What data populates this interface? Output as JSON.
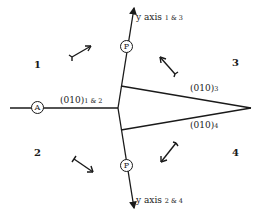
{
  "diagram": {
    "quadrants": [
      {
        "id": "1",
        "label": "1"
      },
      {
        "id": "2",
        "label": "2"
      },
      {
        "id": "3",
        "label": "3"
      },
      {
        "id": "4",
        "label": "4"
      }
    ],
    "planes": [
      {
        "main": "(010)",
        "sub": "1 & 2"
      },
      {
        "main": "(010)",
        "sub": "3"
      },
      {
        "main": "(010)",
        "sub": "4"
      }
    ],
    "axes": [
      {
        "main": "y axis",
        "sub": "1 & 3"
      },
      {
        "main": "y axis",
        "sub": "2 & 4"
      }
    ],
    "markers": {
      "a": "A",
      "p_upper": "P",
      "p_lower": "P"
    },
    "colors": {
      "line": "#1a1a1a",
      "background": "#ffffff"
    }
  }
}
